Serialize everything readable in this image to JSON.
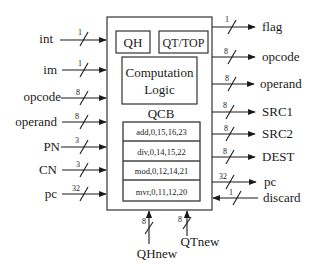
{
  "diagram": {
    "title": "",
    "block": {
      "qh_label": "QH",
      "qt_label": "QT/TOP",
      "logic_line1": "Computation",
      "logic_line2": "Logic",
      "qcb_label": "QCB",
      "qcb_rows": [
        "add,0,15,16,23",
        "div,0,14,15,22",
        "mod,0,12,14,21",
        "mvr,0,11,12,20"
      ]
    },
    "inputs_left": [
      {
        "name": "int",
        "width": "1"
      },
      {
        "name": "im",
        "width": "1"
      },
      {
        "name": "opcode",
        "width": "8"
      },
      {
        "name": "operand",
        "width": "8"
      },
      {
        "name": "PN",
        "width": "3"
      },
      {
        "name": "CN",
        "width": "3"
      },
      {
        "name": "pc",
        "width": "32"
      }
    ],
    "outputs_right": [
      {
        "name": "flag",
        "width": "1"
      },
      {
        "name": "opcode",
        "width": "8"
      },
      {
        "name": "operand",
        "width": "8"
      },
      {
        "name": "SRC1",
        "width": "8"
      },
      {
        "name": "SRC2",
        "width": "8"
      },
      {
        "name": "DEST",
        "width": "8"
      },
      {
        "name": "pc",
        "width": "32"
      }
    ],
    "inputs_right": [
      {
        "name": "discard",
        "width": "1"
      }
    ],
    "inputs_bottom": [
      {
        "name": "QHnew",
        "width": "8"
      },
      {
        "name": "QTnew",
        "width": "8"
      }
    ]
  }
}
